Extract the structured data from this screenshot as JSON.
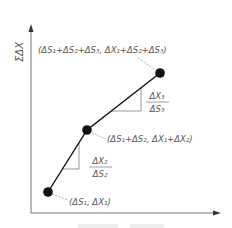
{
  "diagram": {
    "y_axis_label": "ΣΔX",
    "x_axis_label": "",
    "points": [
      {
        "id": "p1",
        "label": "(ΔS₁, ΔX₁)"
      },
      {
        "id": "p2",
        "label": "(ΔS₁+ΔS₂, ΔX₁+ΔX₂)"
      },
      {
        "id": "p3",
        "label": "(ΔS₁+ΔS₂+ΔS₃, ΔX₁+ΔS₂+ΔS₃)"
      }
    ],
    "slopes": [
      {
        "id": "slope2",
        "numerator": "ΔX₂",
        "denominator": "ΔS₂"
      },
      {
        "id": "slope3",
        "numerator": "ΔX₃",
        "denominator": "ΔS₃"
      }
    ],
    "colors": {
      "axis": "#777777",
      "line": "#111111",
      "point": "#111111",
      "triangle": "#999999",
      "leader": "#999999",
      "text": "#555555"
    }
  }
}
